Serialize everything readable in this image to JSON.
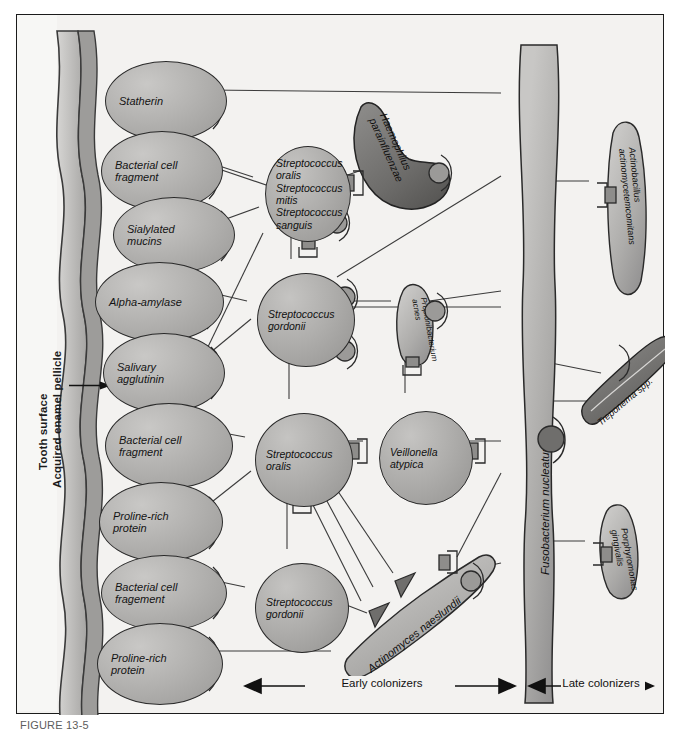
{
  "figure": {
    "caption_visible": "FIGURE 13-5",
    "tooth_label": "Tooth surface",
    "pellicle_label": "Acquired enamel pellicle"
  },
  "axis": {
    "early_label": "Early colonizers",
    "late_label": "Late colonizers"
  },
  "pellicle_molecules": [
    {
      "label": "Statherin",
      "x": 88,
      "y": 46,
      "w": 120,
      "h": 78
    },
    {
      "label": "Bacterial cell\nfragment",
      "x": 84,
      "y": 116,
      "w": 120,
      "h": 78
    },
    {
      "label": "Sialylated\nmucins",
      "x": 96,
      "y": 182,
      "w": 120,
      "h": 74
    },
    {
      "label": "Alpha-amylase",
      "x": 78,
      "y": 247,
      "w": 127,
      "h": 78
    },
    {
      "label": "Salivary\nagglutinin",
      "x": 86,
      "y": 318,
      "w": 120,
      "h": 78
    },
    {
      "label": "Bacterial cell\nfragment",
      "x": 88,
      "y": 388,
      "w": 126,
      "h": 84
    },
    {
      "label": "Proline-rich\nprotein",
      "x": 82,
      "y": 467,
      "w": 122,
      "h": 78
    },
    {
      "label": "Bacterial cell\nfragement",
      "x": 84,
      "y": 540,
      "w": 124,
      "h": 74
    },
    {
      "label": "Proline-rich\nprotein",
      "x": 80,
      "y": 608,
      "w": 124,
      "h": 80
    }
  ],
  "bacteria_cocci": [
    {
      "label": "Streptococcus\noralis\nStreptococcus\nmitis\nStreptococcus\nsanguis",
      "x": 248,
      "y": 131,
      "w": 84,
      "h": 94
    },
    {
      "label": "Streptococcus\ngordonii",
      "x": 240,
      "y": 258,
      "w": 96,
      "h": 92
    },
    {
      "label": "Streptococcus\noralis",
      "x": 238,
      "y": 398,
      "w": 96,
      "h": 92
    },
    {
      "label": "Veillonella\natypica",
      "x": 362,
      "y": 396,
      "w": 92,
      "h": 92
    },
    {
      "label": "Streptococcus\ngordonii",
      "x": 238,
      "y": 548,
      "w": 92,
      "h": 88
    }
  ],
  "bacteria_rods": [
    {
      "label": "Haemophilus\nparainfluenzae",
      "group": "early"
    },
    {
      "label": "Propionibacterium\nacnes",
      "group": "early"
    },
    {
      "label": "Actinomyces naeslundii",
      "group": "early"
    },
    {
      "label": "Fusobacterium nucleatum",
      "group": "bridge"
    },
    {
      "label": "Actinobacillus\nactinomycetemcomitans",
      "group": "late"
    },
    {
      "label": "Treponema spp.",
      "group": "late"
    },
    {
      "label": "Porphyromonas\ngingivalis",
      "group": "late"
    }
  ],
  "colors": {
    "frame_bg": "#f3f2f0",
    "cell_fill": "#aeadab",
    "dark_cell_fill": "#6e6d6b",
    "outline": "#2a2a2a",
    "text": "#111111"
  }
}
